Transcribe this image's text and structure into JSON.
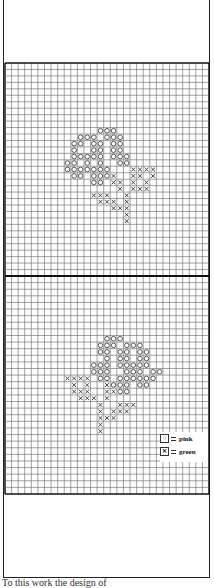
{
  "page": {
    "caption": "To this work the design of"
  },
  "legend": {
    "items": [
      {
        "symbol": "circle-symbol",
        "label": "pink",
        "color": "#d98aa0"
      },
      {
        "symbol": "cross-symbol",
        "label": "green",
        "color": "#4a7a3a"
      }
    ]
  },
  "grid": {
    "columns": 31,
    "top_section_rows": 33,
    "bottom_section_rows": 33
  },
  "motifs": {
    "top": {
      "pink_cells": [
        [
          14,
          10
        ],
        [
          15,
          10
        ],
        [
          16,
          10
        ],
        [
          11,
          11
        ],
        [
          12,
          11
        ],
        [
          13,
          11
        ],
        [
          15,
          11
        ],
        [
          16,
          11
        ],
        [
          17,
          11
        ],
        [
          10,
          12
        ],
        [
          11,
          12
        ],
        [
          13,
          12
        ],
        [
          14,
          12
        ],
        [
          16,
          12
        ],
        [
          17,
          12
        ],
        [
          10,
          13
        ],
        [
          13,
          13
        ],
        [
          14,
          13
        ],
        [
          16,
          13
        ],
        [
          17,
          13
        ],
        [
          10,
          14
        ],
        [
          11,
          14
        ],
        [
          12,
          14
        ],
        [
          13,
          14
        ],
        [
          14,
          14
        ],
        [
          16,
          14
        ],
        [
          17,
          14
        ],
        [
          18,
          14
        ],
        [
          9,
          15
        ],
        [
          10,
          15
        ],
        [
          12,
          15
        ],
        [
          14,
          15
        ],
        [
          17,
          15
        ],
        [
          18,
          15
        ],
        [
          9,
          16
        ],
        [
          10,
          16
        ],
        [
          11,
          16
        ],
        [
          12,
          16
        ],
        [
          13,
          16
        ],
        [
          14,
          16
        ],
        [
          15,
          16
        ],
        [
          10,
          17
        ],
        [
          11,
          17
        ],
        [
          13,
          17
        ],
        [
          14,
          17
        ],
        [
          15,
          17
        ],
        [
          13,
          18
        ],
        [
          14,
          18
        ]
      ],
      "green_cells": [
        [
          19,
          16
        ],
        [
          20,
          16
        ],
        [
          21,
          16
        ],
        [
          22,
          16
        ],
        [
          16,
          17
        ],
        [
          19,
          17
        ],
        [
          20,
          17
        ],
        [
          22,
          17
        ],
        [
          16,
          18
        ],
        [
          17,
          18
        ],
        [
          19,
          18
        ],
        [
          21,
          18
        ],
        [
          17,
          19
        ],
        [
          19,
          19
        ],
        [
          20,
          19
        ],
        [
          21,
          19
        ],
        [
          13,
          20
        ],
        [
          14,
          20
        ],
        [
          15,
          20
        ],
        [
          18,
          20
        ],
        [
          14,
          21
        ],
        [
          15,
          21
        ],
        [
          16,
          21
        ],
        [
          18,
          21
        ],
        [
          16,
          22
        ],
        [
          17,
          22
        ],
        [
          18,
          22
        ],
        [
          18,
          23
        ],
        [
          18,
          24
        ]
      ]
    },
    "bottom": {
      "pink_cells": [
        [
          15,
          9
        ],
        [
          16,
          9
        ],
        [
          17,
          9
        ],
        [
          14,
          10
        ],
        [
          15,
          10
        ],
        [
          16,
          10
        ],
        [
          18,
          10
        ],
        [
          19,
          10
        ],
        [
          20,
          10
        ],
        [
          14,
          11
        ],
        [
          15,
          11
        ],
        [
          17,
          11
        ],
        [
          18,
          11
        ],
        [
          20,
          11
        ],
        [
          21,
          11
        ],
        [
          15,
          12
        ],
        [
          17,
          12
        ],
        [
          18,
          12
        ],
        [
          20,
          12
        ],
        [
          21,
          12
        ],
        [
          13,
          13
        ],
        [
          14,
          13
        ],
        [
          15,
          13
        ],
        [
          17,
          13
        ],
        [
          18,
          13
        ],
        [
          19,
          13
        ],
        [
          20,
          13
        ],
        [
          21,
          13
        ],
        [
          13,
          14
        ],
        [
          14,
          14
        ],
        [
          15,
          14
        ],
        [
          18,
          14
        ],
        [
          19,
          14
        ],
        [
          20,
          14
        ],
        [
          22,
          14
        ],
        [
          23,
          14
        ],
        [
          14,
          15
        ],
        [
          15,
          15
        ],
        [
          17,
          15
        ],
        [
          18,
          15
        ],
        [
          19,
          15
        ],
        [
          20,
          15
        ],
        [
          21,
          15
        ],
        [
          22,
          15
        ],
        [
          16,
          16
        ],
        [
          17,
          16
        ],
        [
          18,
          16
        ],
        [
          20,
          16
        ],
        [
          21,
          16
        ],
        [
          17,
          17
        ],
        [
          18,
          17
        ]
      ],
      "green_cells": [
        [
          9,
          15
        ],
        [
          10,
          15
        ],
        [
          11,
          15
        ],
        [
          12,
          15
        ],
        [
          10,
          16
        ],
        [
          12,
          16
        ],
        [
          15,
          16
        ],
        [
          10,
          17
        ],
        [
          11,
          17
        ],
        [
          12,
          17
        ],
        [
          15,
          17
        ],
        [
          16,
          17
        ],
        [
          11,
          18
        ],
        [
          12,
          18
        ],
        [
          13,
          18
        ],
        [
          15,
          18
        ],
        [
          14,
          19
        ],
        [
          17,
          19
        ],
        [
          18,
          19
        ],
        [
          19,
          19
        ],
        [
          14,
          20
        ],
        [
          16,
          20
        ],
        [
          17,
          20
        ],
        [
          18,
          20
        ],
        [
          14,
          21
        ],
        [
          15,
          21
        ],
        [
          16,
          21
        ],
        [
          14,
          22
        ],
        [
          14,
          23
        ]
      ]
    }
  }
}
